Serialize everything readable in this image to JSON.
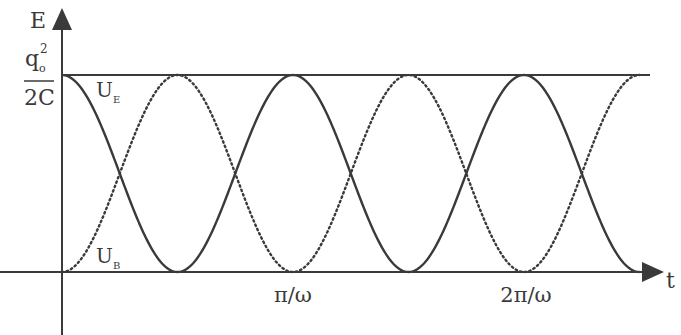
{
  "chart_data": {
    "type": "line",
    "title": "",
    "xlabel": "t",
    "ylabel": "E",
    "ylim": [
      0,
      1
    ],
    "y_ticks": [
      {
        "value": 1,
        "label_num": "q",
        "label_num_sub": "o",
        "label_num_sup": "2",
        "label_den": "2C"
      }
    ],
    "x_ticks": [
      {
        "value": 1,
        "label": "π/ω"
      },
      {
        "value": 2,
        "label": "2π/ω"
      }
    ],
    "x_unit": "π/ω",
    "xlim": [
      0,
      2.55
    ],
    "grid": false,
    "legend": "inline labels",
    "series": [
      {
        "name": "U_E",
        "label_main": "U",
        "label_sub": "E",
        "style": "solid",
        "function": "cos^2(ωt)",
        "x_end": 2.5,
        "x": [
          0,
          0.25,
          0.5,
          0.75,
          1,
          1.25,
          1.5,
          1.75,
          2,
          2.25,
          2.5
        ],
        "values": [
          1,
          0.5,
          0,
          0.5,
          1,
          0.5,
          0,
          0.5,
          1,
          0.5,
          0
        ]
      },
      {
        "name": "U_B",
        "label_main": "U",
        "label_sub": "B",
        "style": "dotted",
        "function": "sin^2(ωt)",
        "x_end": 2.5,
        "x": [
          0,
          0.25,
          0.5,
          0.75,
          1,
          1.25,
          1.5,
          1.75,
          2,
          2.25,
          2.5
        ],
        "values": [
          0,
          0.5,
          1,
          0.5,
          0,
          0.5,
          1,
          0.5,
          0,
          0.5,
          1
        ]
      }
    ],
    "reference_line": {
      "value": 1,
      "label": "q_o^2 / 2C"
    }
  },
  "axes": {
    "y_label": "E",
    "x_label": "t"
  },
  "colors": {
    "ink": "#3a3a3a",
    "background": "#ffffff"
  }
}
